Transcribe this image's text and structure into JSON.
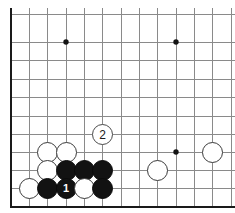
{
  "board": {
    "kind": "go-board-diagram",
    "title": "Go board corner diagram",
    "background_color": "#ffffff",
    "line_color": "#8a8a8a",
    "border_color": "#1a1a1a",
    "grid": {
      "spacing": 18.33,
      "x_lines": [
        11,
        29.3,
        47.7,
        66,
        84.3,
        102.7,
        121,
        139.3,
        157.7,
        176,
        194.3,
        212.7,
        231
      ],
      "y_lines": [
        14,
        42,
        60.5,
        79,
        97.5,
        116,
        134.5,
        152,
        170.5,
        188
      ],
      "bottom_edge_y": 207,
      "left_edge_x": 11
    },
    "star_points": [
      {
        "name": "star-point-upper-left",
        "x": 66,
        "y": 42
      },
      {
        "name": "star-point-upper-right",
        "x": 176,
        "y": 42
      },
      {
        "name": "star-point-lower-right",
        "x": 176,
        "y": 152
      }
    ],
    "stone_radius": 10.5,
    "stones": [
      {
        "id": "white-a",
        "color": "white",
        "x": 47.7,
        "y": 152,
        "label": ""
      },
      {
        "id": "white-b",
        "color": "white",
        "x": 66,
        "y": 152,
        "label": ""
      },
      {
        "id": "white-c",
        "color": "white",
        "x": 47.7,
        "y": 170.5,
        "label": ""
      },
      {
        "id": "black-a",
        "color": "black",
        "x": 66,
        "y": 170.5,
        "label": ""
      },
      {
        "id": "black-b",
        "color": "black",
        "x": 84.3,
        "y": 170.5,
        "label": ""
      },
      {
        "id": "black-c",
        "color": "black",
        "x": 102.7,
        "y": 170.5,
        "label": ""
      },
      {
        "id": "white-d",
        "color": "white",
        "x": 29.3,
        "y": 188,
        "label": ""
      },
      {
        "id": "black-d",
        "color": "black",
        "x": 47.7,
        "y": 188,
        "label": ""
      },
      {
        "id": "black-move-1",
        "color": "black",
        "x": 66,
        "y": 188,
        "label": "1"
      },
      {
        "id": "white-e",
        "color": "white",
        "x": 84.3,
        "y": 188,
        "label": ""
      },
      {
        "id": "black-e",
        "color": "black",
        "x": 102.7,
        "y": 188,
        "label": ""
      },
      {
        "id": "white-f",
        "color": "white",
        "x": 157.7,
        "y": 170.5,
        "label": ""
      },
      {
        "id": "white-g",
        "color": "white",
        "x": 212.7,
        "y": 152,
        "label": ""
      }
    ],
    "markers": [
      {
        "id": "white-move-2",
        "x": 102.7,
        "y": 134.5,
        "label": "2",
        "color": "white"
      }
    ]
  }
}
